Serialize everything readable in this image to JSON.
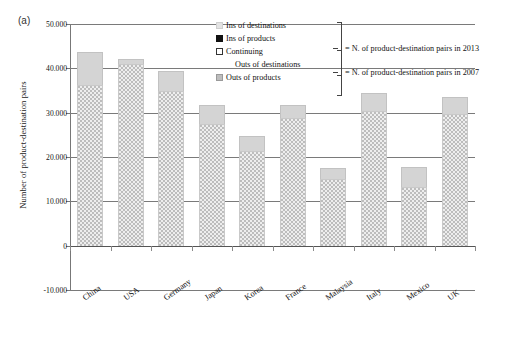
{
  "figure": {
    "panel_label": "(a)"
  },
  "chart_data": {
    "type": "bar",
    "title": "",
    "xlabel": "",
    "ylabel": "Number of product-destination pairs",
    "ylim": [
      -10000,
      50000
    ],
    "ytick_values": [
      50000,
      40000,
      30000,
      20000,
      10000,
      0,
      -10000
    ],
    "ytick_labels": [
      "50.000",
      "40.000",
      "30.000",
      "20.000",
      "10.000",
      "0",
      "-10.000"
    ],
    "grid": true,
    "stacked": true,
    "legend_position": "top-center",
    "categories": [
      "China",
      "USA",
      "Germany",
      "Japan",
      "Korea",
      "France",
      "Malaysia",
      "Italy",
      "Mexico",
      "UK"
    ],
    "series": [
      {
        "name": "pairs_2007_lower",
        "label": "Continuing + Outs (2007 base)",
        "values": [
          36200,
          40900,
          34800,
          27400,
          21300,
          28800,
          15100,
          30300,
          13300,
          29700
        ]
      },
      {
        "name": "ins_upper",
        "label": "Ins (2013 additions)",
        "values": [
          7600,
          1300,
          4500,
          4300,
          3400,
          2900,
          2400,
          4100,
          4500,
          3800
        ]
      }
    ],
    "totals_2013": [
      43800,
      42200,
      39300,
      31700,
      24700,
      31700,
      17500,
      34400,
      17800,
      33500
    ]
  },
  "legend": {
    "items": [
      {
        "label": "Ins of destinations",
        "swatch": "light-grey-square",
        "indent": false
      },
      {
        "label": "Ins of products",
        "swatch": "black-square",
        "indent": false
      },
      {
        "label": "Continuing",
        "swatch": "white-square",
        "indent": false
      },
      {
        "label": "Outs of destinations",
        "swatch": "none",
        "indent": true
      },
      {
        "label": "Outs of products",
        "swatch": "grey-square",
        "indent": false
      }
    ],
    "annotations": [
      {
        "text": "= N. of product-destination pairs in 2013"
      },
      {
        "text": "= N. of product-destination pairs in 2007"
      }
    ]
  },
  "colors": {
    "bar_lower": "#eeeeee",
    "bar_upper": "#d4d4d4",
    "gridline": "#7a7a7a",
    "text": "#111111"
  }
}
